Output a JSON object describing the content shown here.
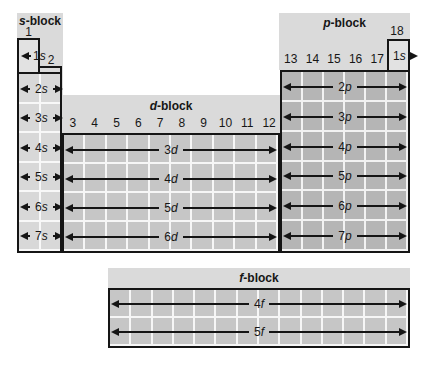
{
  "palette": {
    "band_gray": "#dadada",
    "s_cell_gray": "#d8d8d8",
    "d_cell_gray": "#c6c6c6",
    "p_cell_gray": "#b5b5b5",
    "f_cell_gray": "#c6c6c6",
    "one_s_box_gray": "#e2e2e2",
    "gridline_white": "#f6f6f6",
    "line_black": "#151515",
    "page_background": "#ffffff"
  },
  "s_block": {
    "label": {
      "letter": "s",
      "suffix": "-block"
    },
    "group_1": "1",
    "group_2": "2",
    "box_1s": {
      "n": "1",
      "l": "s"
    },
    "rows": [
      {
        "n": "2",
        "l": "s"
      },
      {
        "n": "3",
        "l": "s"
      },
      {
        "n": "4",
        "l": "s"
      },
      {
        "n": "5",
        "l": "s"
      },
      {
        "n": "6",
        "l": "s"
      },
      {
        "n": "7",
        "l": "s"
      }
    ]
  },
  "d_block": {
    "label": {
      "letter": "d",
      "suffix": "-block"
    },
    "groups": [
      "3",
      "4",
      "5",
      "6",
      "7",
      "8",
      "9",
      "10",
      "11",
      "12"
    ],
    "rows": [
      {
        "n": "3",
        "l": "d"
      },
      {
        "n": "4",
        "l": "d"
      },
      {
        "n": "5",
        "l": "d"
      },
      {
        "n": "6",
        "l": "d"
      }
    ]
  },
  "p_block": {
    "label": {
      "letter": "p",
      "suffix": "-block"
    },
    "group_18": "18",
    "groups": [
      "13",
      "14",
      "15",
      "16",
      "17"
    ],
    "box_1s": {
      "n": "1",
      "l": "s"
    },
    "rows": [
      {
        "n": "2",
        "l": "p"
      },
      {
        "n": "3",
        "l": "p"
      },
      {
        "n": "4",
        "l": "p"
      },
      {
        "n": "5",
        "l": "p"
      },
      {
        "n": "6",
        "l": "p"
      },
      {
        "n": "7",
        "l": "p"
      }
    ]
  },
  "f_block": {
    "label": {
      "letter": "f",
      "suffix": "-block"
    },
    "rows": [
      {
        "n": "4",
        "l": "f"
      },
      {
        "n": "5",
        "l": "f"
      }
    ]
  }
}
